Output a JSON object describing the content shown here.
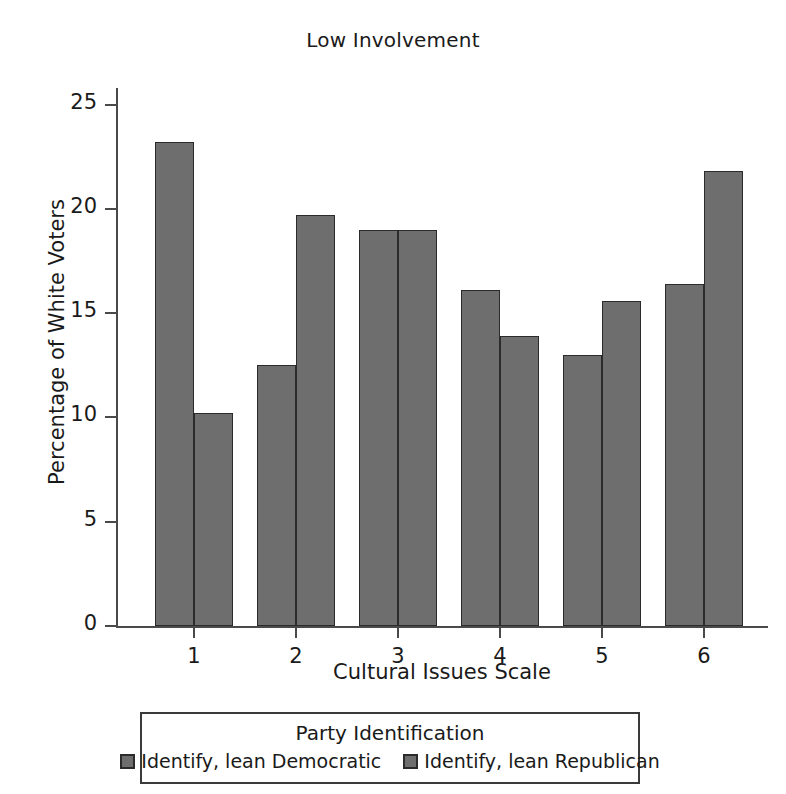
{
  "chart_data": {
    "type": "bar",
    "title": "Low Involvement",
    "xlabel": "Cultural Issues Scale",
    "ylabel": "Percentage of White Voters",
    "categories": [
      "1",
      "2",
      "3",
      "4",
      "5",
      "6"
    ],
    "series": [
      {
        "name": "Identify, lean Democratic",
        "values": [
          23.2,
          12.5,
          19.0,
          16.1,
          13.0,
          16.4
        ],
        "color": "#6e6e6e"
      },
      {
        "name": "Identify, lean Republican",
        "values": [
          10.2,
          19.7,
          19.0,
          13.9,
          15.6,
          21.8
        ],
        "color": "#6e6e6e"
      }
    ],
    "ylim": [
      0,
      25.8
    ],
    "yticks": [
      0,
      5,
      10,
      15,
      20,
      25
    ],
    "ytick_labels": [
      "0",
      "5",
      "10",
      "15",
      "20",
      "25"
    ],
    "grid": false,
    "legend": {
      "title": "Party Identification",
      "position": "below-axes",
      "entries": [
        "Identify, lean Democratic",
        "Identify, lean Republican"
      ]
    }
  },
  "style": {
    "bar_fill": "#6e6e6e",
    "bar_edge": "#2b2b2b",
    "axis_color": "#4a4a4a",
    "text_color": "#1a1a1a",
    "background": "#ffffff"
  }
}
